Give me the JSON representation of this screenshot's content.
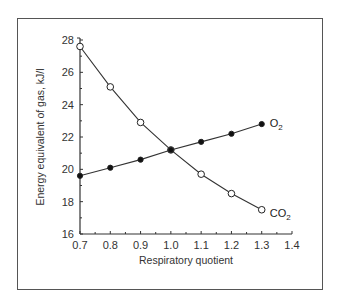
{
  "chart_data": {
    "type": "line",
    "title": "",
    "xlabel": "Respiratory quotient",
    "ylabel": "Energy equivalent of gas, kJ/l",
    "x": [
      0.7,
      0.8,
      0.9,
      1.0,
      1.1,
      1.2,
      1.3
    ],
    "xlim": [
      0.7,
      1.4
    ],
    "ylim": [
      16,
      28
    ],
    "xticks": [
      "0.7",
      "0.8",
      "0.9",
      "1.0",
      "1.1",
      "1.2",
      "1.3",
      "1.4"
    ],
    "yticks": [
      "16",
      "18",
      "20",
      "22",
      "24",
      "26",
      "28"
    ],
    "grid": false,
    "legend_position": "inline-end-labels",
    "series": [
      {
        "name": "CO2",
        "label_main": "CO",
        "label_sub": "2",
        "marker": "open-circle",
        "values": [
          27.6,
          25.1,
          22.9,
          21.2,
          19.7,
          18.5,
          17.5
        ]
      },
      {
        "name": "O2",
        "label_main": "O",
        "label_sub": "2",
        "marker": "filled-circle",
        "values": [
          19.6,
          20.1,
          20.6,
          21.2,
          21.7,
          22.2,
          22.8
        ]
      }
    ]
  },
  "colors": {
    "line": "#333333",
    "frame": "#555555",
    "text": "#333333"
  }
}
